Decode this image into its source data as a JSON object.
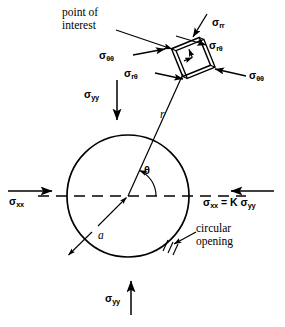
{
  "figure": {
    "background_color": "#ffffff",
    "line_color": "#000000",
    "width": 285,
    "height": 327
  },
  "annotations": {
    "point_of_interest_line1": "point of",
    "point_of_interest_line2": "interest",
    "circular_opening_line1": "circular",
    "circular_opening_line2": "opening",
    "radius_label": "a",
    "radial_distance_label": "r",
    "angle_label": "θ"
  },
  "stress_labels": {
    "sigma_rr": {
      "symbol": "σ",
      "subscript": "rr"
    },
    "sigma_r_theta_top": {
      "symbol": "σ",
      "subscript": "rθ"
    },
    "sigma_r_theta_bottom": {
      "symbol": "σ",
      "subscript": "rθ"
    },
    "sigma_theta_theta_left": {
      "symbol": "σ",
      "subscript": "θθ"
    },
    "sigma_theta_theta_right": {
      "symbol": "σ",
      "subscript": "θθ"
    },
    "sigma_yy_top": {
      "symbol": "σ",
      "subscript": "yy"
    },
    "sigma_yy_bottom": {
      "symbol": "σ",
      "subscript": "yy"
    },
    "sigma_xx_left": {
      "symbol": "σ",
      "subscript": "xx"
    },
    "sigma_xx_right_equation": {
      "symbol": "σ",
      "subscript": "xx",
      "relation": " = K ",
      "symbol2": "σ",
      "subscript2": "yy"
    }
  },
  "geometry": {
    "circle_center_x": 128,
    "circle_center_y": 196,
    "circle_radius": 61,
    "element_center_x": 191,
    "element_center_y": 57,
    "element_half_size": 15,
    "element_rotation_deg": -22,
    "theta_arc_radius": 28,
    "centerline_start_x": 38,
    "centerline_end_x": 246
  }
}
